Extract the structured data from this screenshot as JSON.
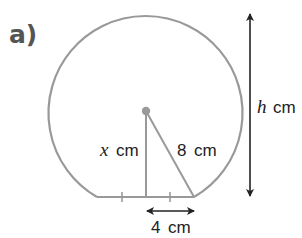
{
  "figure": {
    "part_label": "a)",
    "shape": "circle segment (major segment cut by a chord)",
    "colors": {
      "shape_stroke": "#999999",
      "arrow": "#222222",
      "center_dot": "#999999",
      "part_label": "#555555",
      "text": "#222222"
    },
    "labels": {
      "perpendicular_var": "x",
      "perpendicular_unit": "cm",
      "radius_value": "8",
      "radius_unit": "cm",
      "half_chord_value": "4",
      "half_chord_unit": "cm",
      "height_var": "h",
      "height_unit": "cm"
    }
  }
}
